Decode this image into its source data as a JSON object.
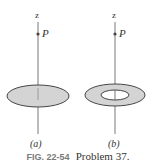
{
  "panels": [
    {
      "id": "a",
      "label": "(a)",
      "axis_label": "z",
      "point_label": "P",
      "shape": "disk"
    },
    {
      "id": "b",
      "label": "(b)",
      "axis_label": "z",
      "point_label": "P",
      "shape": "ring"
    }
  ],
  "caption": {
    "figure": "FIG. 22-54",
    "text": "Problem 37."
  },
  "colors": {
    "fill": "#d4d4d4",
    "stroke": "#333333",
    "axis": "#555555"
  }
}
